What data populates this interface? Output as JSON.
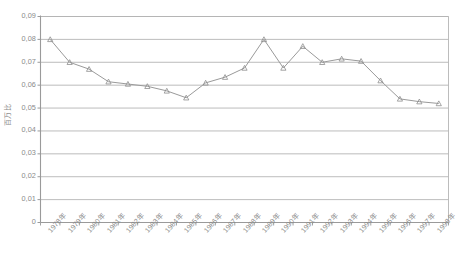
{
  "chart_data": {
    "type": "line",
    "title": "",
    "xlabel": "",
    "ylabel": "百万比",
    "ylim": [
      0,
      0.09
    ],
    "ytick_values": [
      0.09,
      0.08,
      0.07,
      0.06,
      0.05,
      0.04,
      0.03,
      0.02,
      0.01,
      0
    ],
    "ytick_labels": [
      "0,09",
      "0,08",
      "0,07",
      "0,06",
      "0,05",
      "0,04",
      "0,03",
      "0,02",
      "0,01",
      "0"
    ],
    "grid": true,
    "legend": "none",
    "marker": "triangle",
    "line_color": "#9a9a9a",
    "marker_color": "#8e8e8e",
    "grid_color": "#b4b4b4",
    "axis_color": "#9a9a9a",
    "categories": [
      "1978年",
      "1979年",
      "1980年",
      "1981年",
      "1982年",
      "1983年",
      "1984年",
      "1985年",
      "1986年",
      "1987年",
      "1988年",
      "1989年",
      "1990年",
      "1991年",
      "1992年",
      "1993年",
      "1994年",
      "1995年",
      "1996年",
      "1997年",
      "1998年"
    ],
    "values": [
      0.08,
      0.07,
      0.067,
      0.0615,
      0.0605,
      0.0595,
      0.0575,
      0.0545,
      0.061,
      0.0635,
      0.0675,
      0.08,
      0.0675,
      0.077,
      0.07,
      0.0715,
      0.0705,
      0.062,
      0.054,
      0.0528,
      0.052
    ]
  }
}
